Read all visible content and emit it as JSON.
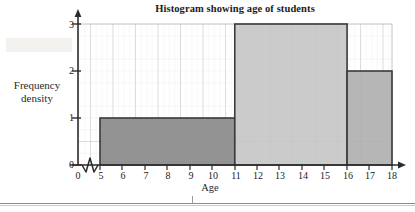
{
  "chart_data": {
    "type": "bar",
    "title": "Histogram showing age of students",
    "xlabel": "Age",
    "ylabel_line1": "Frequency",
    "ylabel_line2": "density",
    "ylabel": "Frequency density",
    "xlim": [
      5,
      18
    ],
    "ylim": [
      0,
      3
    ],
    "axis_break": true,
    "axis_break_symbol": "zigzag",
    "grid": true,
    "grid_minor": true,
    "legend": "none",
    "x_ticks": [
      "0",
      "5",
      "6",
      "7",
      "8",
      "9",
      "10",
      "11",
      "12",
      "13",
      "14",
      "15",
      "16",
      "17",
      "18"
    ],
    "y_ticks": [
      "0",
      "1",
      "2",
      "3"
    ],
    "categories": [
      "5-11",
      "11-16",
      "16-18"
    ],
    "values": [
      1,
      3,
      2
    ],
    "bars": [
      {
        "label": "5-11",
        "x_start": 5,
        "x_end": 11,
        "width": 6,
        "density": 1,
        "frequency": 6,
        "fill": "#8a8a8a"
      },
      {
        "label": "11-16",
        "x_start": 11,
        "x_end": 16,
        "width": 5,
        "density": 3,
        "frequency": 15,
        "fill": "#c4c4c4"
      },
      {
        "label": "16-18",
        "x_start": 16,
        "x_end": 18,
        "width": 2,
        "density": 2,
        "frequency": 4,
        "fill": "#aeaeae"
      }
    ]
  },
  "colors": {
    "axis": "#2b2b2b",
    "grid_major": "#b9b9b9",
    "grid_minor": "#dedede",
    "bar_edge": "#3a3a3a",
    "text": "#1b1b1b",
    "background": "#ffffff"
  }
}
